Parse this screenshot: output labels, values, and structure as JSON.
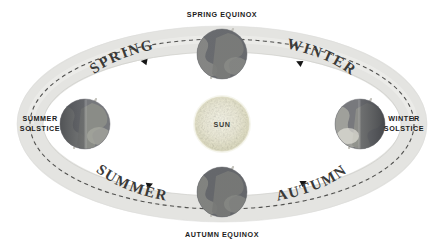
{
  "diagram": {
    "background_color": "#ffffff",
    "center_body": {
      "name": "SUN",
      "color": "#efeedd",
      "edge_color": "#dedcc2"
    },
    "orbit": {
      "ring_color": "#e4e4e1",
      "ring_edge_color": "#d2d2cf",
      "path_style": "dashed",
      "path_color": "#4a4a48",
      "direction": "counterclockwise",
      "arrow_color": "#1a1a1a"
    },
    "earth": {
      "ocean_color": "#6d6f72",
      "land_color": "#9a9b96",
      "shadow_color": "#4a4c50",
      "axis_color": "#b9b8b2"
    },
    "season_labels": [
      {
        "id": "spring",
        "text": "SPRING"
      },
      {
        "id": "winter",
        "text": "WINTER"
      },
      {
        "id": "summer",
        "text": "SUMMER"
      },
      {
        "id": "autumn",
        "text": "AUTUMN"
      }
    ],
    "position_labels": [
      {
        "id": "spring-equinox",
        "line1": "SPRING EQUINOX",
        "line2": ""
      },
      {
        "id": "winter-solstice",
        "line1": "WINTER",
        "line2": "SOLSTICE"
      },
      {
        "id": "autumn-equinox",
        "line1": "AUTUMN EQUINOX",
        "line2": ""
      },
      {
        "id": "summer-solstice",
        "line1": "SUMMER",
        "line2": "SOLSTICE"
      }
    ]
  }
}
